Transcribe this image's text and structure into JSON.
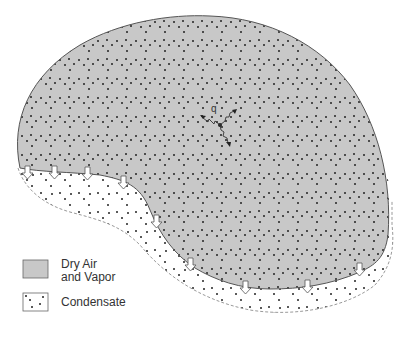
{
  "diagram": {
    "type": "cross-section",
    "regions": [
      {
        "id": "dry-air-vapor",
        "label": "Dry Air and Vapor",
        "fill": "#c8c8c8",
        "pattern": "dots"
      },
      {
        "id": "condensate",
        "label": "Condensate",
        "fill": "#ffffff",
        "pattern": "dots",
        "border": "dashed"
      }
    ],
    "heat_flux_label": "q",
    "condensation_arrow_count": 9
  },
  "legend": {
    "items": [
      {
        "label_line1": "Dry Air",
        "label_line2": "and Vapor",
        "swatch": "gray-dotted"
      },
      {
        "label_line1": "Condensate",
        "swatch": "white-dotted"
      }
    ]
  },
  "colors": {
    "gas_fill": "#c8c8c8",
    "outline": "#555555",
    "dashed_outline": "#9a9a9a",
    "dot": "#222222",
    "arrow_fill": "#ffffff"
  }
}
